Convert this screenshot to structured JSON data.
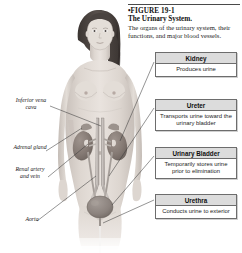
{
  "figure": {
    "number_label": "•FIGURE 19-1",
    "title": "The Urinary System.",
    "description": "The organs of the urinary system, their functions, and major blood vessels."
  },
  "callouts": [
    {
      "name": "kidney",
      "header": "Kidney",
      "body": "Produces urine"
    },
    {
      "name": "ureter",
      "header": "Ureter",
      "body": "Transports urine toward the urinary bladder"
    },
    {
      "name": "urinary-bladder",
      "header": "Urinary Bladder",
      "body": "Temporarily stores urine prior to elimination"
    },
    {
      "name": "urethra",
      "header": "Urethra",
      "body": "Conducts urine to exterior"
    }
  ],
  "anatomy_labels": [
    {
      "name": "inferior-vena-cava",
      "text": "Inferior vena cava"
    },
    {
      "name": "adrenal-gland",
      "text": "Adrenal gland"
    },
    {
      "name": "renal-artery-and-vein",
      "text": "Renal artery and vein"
    },
    {
      "name": "aorta",
      "text": "Aorta"
    }
  ],
  "colors": {
    "box_border": "#6d6d6d",
    "header_fill": "#dcdcdc",
    "leader_line": "#3c3c3c",
    "kidney": "#8a7f7a",
    "bladder": "#8d8682",
    "vessel": "#b9b4b0",
    "skin": "#d9d2cc",
    "hair": "#4a4340",
    "background": "#ffffff"
  }
}
